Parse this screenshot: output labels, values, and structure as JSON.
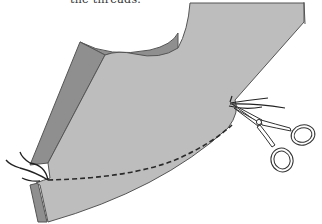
{
  "caption": {
    "text": "the threads."
  },
  "illustration": {
    "subject": "fabric panel with basting stitch and scissors snipping threads",
    "elements": [
      "fabric-panel",
      "folded-edge",
      "dashed-stitch-line",
      "thread-ends-left",
      "thread-ends-right",
      "scissors-icon"
    ],
    "colors": {
      "fabric_light": "#bdbdbd",
      "fabric_dark": "#8f8f8f",
      "outline": "#555555",
      "stitch": "#2a2a2a",
      "thread": "#222222",
      "scissors_fill": "#ffffff",
      "background": "#ffffff"
    }
  }
}
